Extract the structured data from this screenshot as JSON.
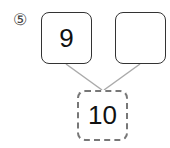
{
  "problem": {
    "number_marker": "⑤",
    "left_box": "9",
    "right_box": "",
    "total_box": "10"
  },
  "colors": {
    "box_border": "#333333",
    "dashed_border": "#777777",
    "connector_line": "#aaaaaa"
  }
}
